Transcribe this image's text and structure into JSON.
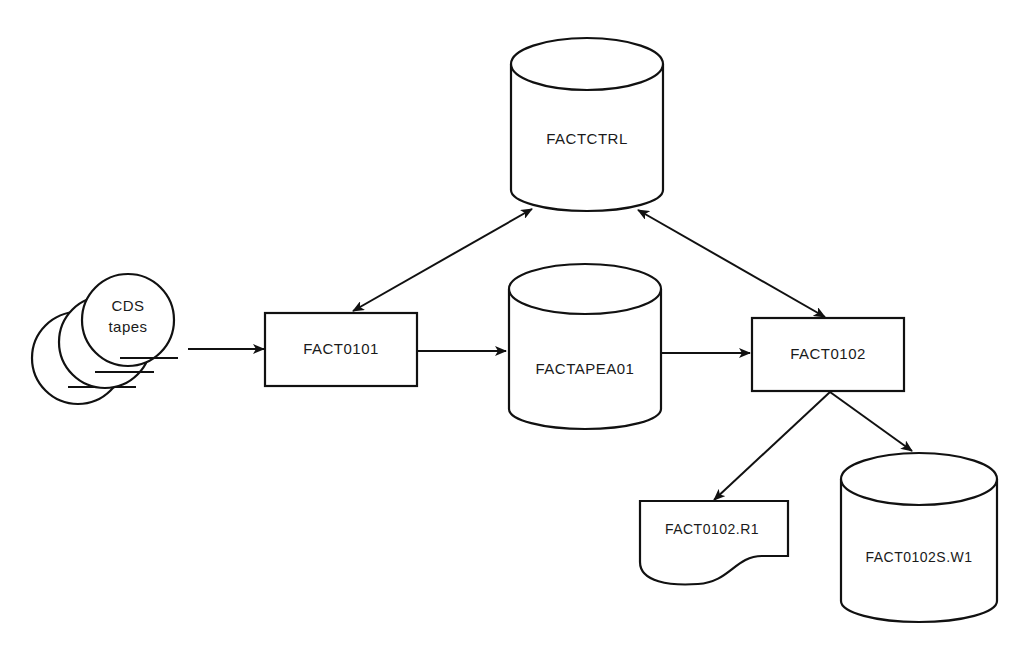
{
  "diagram": {
    "colors": {
      "ink": "#111111",
      "background": "#ffffff"
    },
    "nodes": {
      "cds_tapes": {
        "type": "tape-stack",
        "label_line1": "CDS",
        "label_line2": "tapes"
      },
      "fact0101": {
        "type": "process",
        "label": "FACT0101"
      },
      "factctrl": {
        "type": "datastore",
        "label": "FACTCTRL"
      },
      "factapea01": {
        "type": "datastore",
        "label": "FACTAPEA01"
      },
      "fact0102": {
        "type": "process",
        "label": "FACT0102"
      },
      "fact0102_r1": {
        "type": "document",
        "label": "FACT0102.R1"
      },
      "fact0102s_w1": {
        "type": "datastore",
        "label": "FACT0102S.W1"
      }
    },
    "edges": [
      {
        "from": "CDS tapes",
        "to": "FACT0101",
        "direction": "one-way"
      },
      {
        "from": "FACT0101",
        "to": "FACTAPEA01",
        "direction": "one-way"
      },
      {
        "from": "FACTAPEA01",
        "to": "FACT0102",
        "direction": "one-way"
      },
      {
        "from": "FACT0101",
        "to": "FACTCTRL",
        "direction": "two-way"
      },
      {
        "from": "FACT0102",
        "to": "FACTCTRL",
        "direction": "two-way"
      },
      {
        "from": "FACT0102",
        "to": "FACT0102.R1",
        "direction": "one-way"
      },
      {
        "from": "FACT0102",
        "to": "FACT0102S.W1",
        "direction": "one-way"
      }
    ]
  }
}
